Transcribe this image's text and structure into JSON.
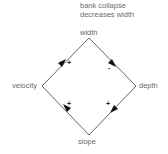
{
  "annotation": {
    "line1": "bank collapse",
    "line2": "decreases width"
  },
  "nodes": {
    "top": "width",
    "left": "velocity",
    "right": "depth",
    "bottom": "slope"
  },
  "edges": [
    {
      "from": "velocity",
      "to": "width",
      "sign": "+"
    },
    {
      "from": "width",
      "to": "depth",
      "sign": "-"
    },
    {
      "from": "depth",
      "to": "slope",
      "sign": "+"
    },
    {
      "from": "slope",
      "to": "velocity",
      "sign": "+"
    }
  ],
  "colors": {
    "line": "#555555",
    "arrow": "#111111",
    "label": "#6b6b6b"
  }
}
